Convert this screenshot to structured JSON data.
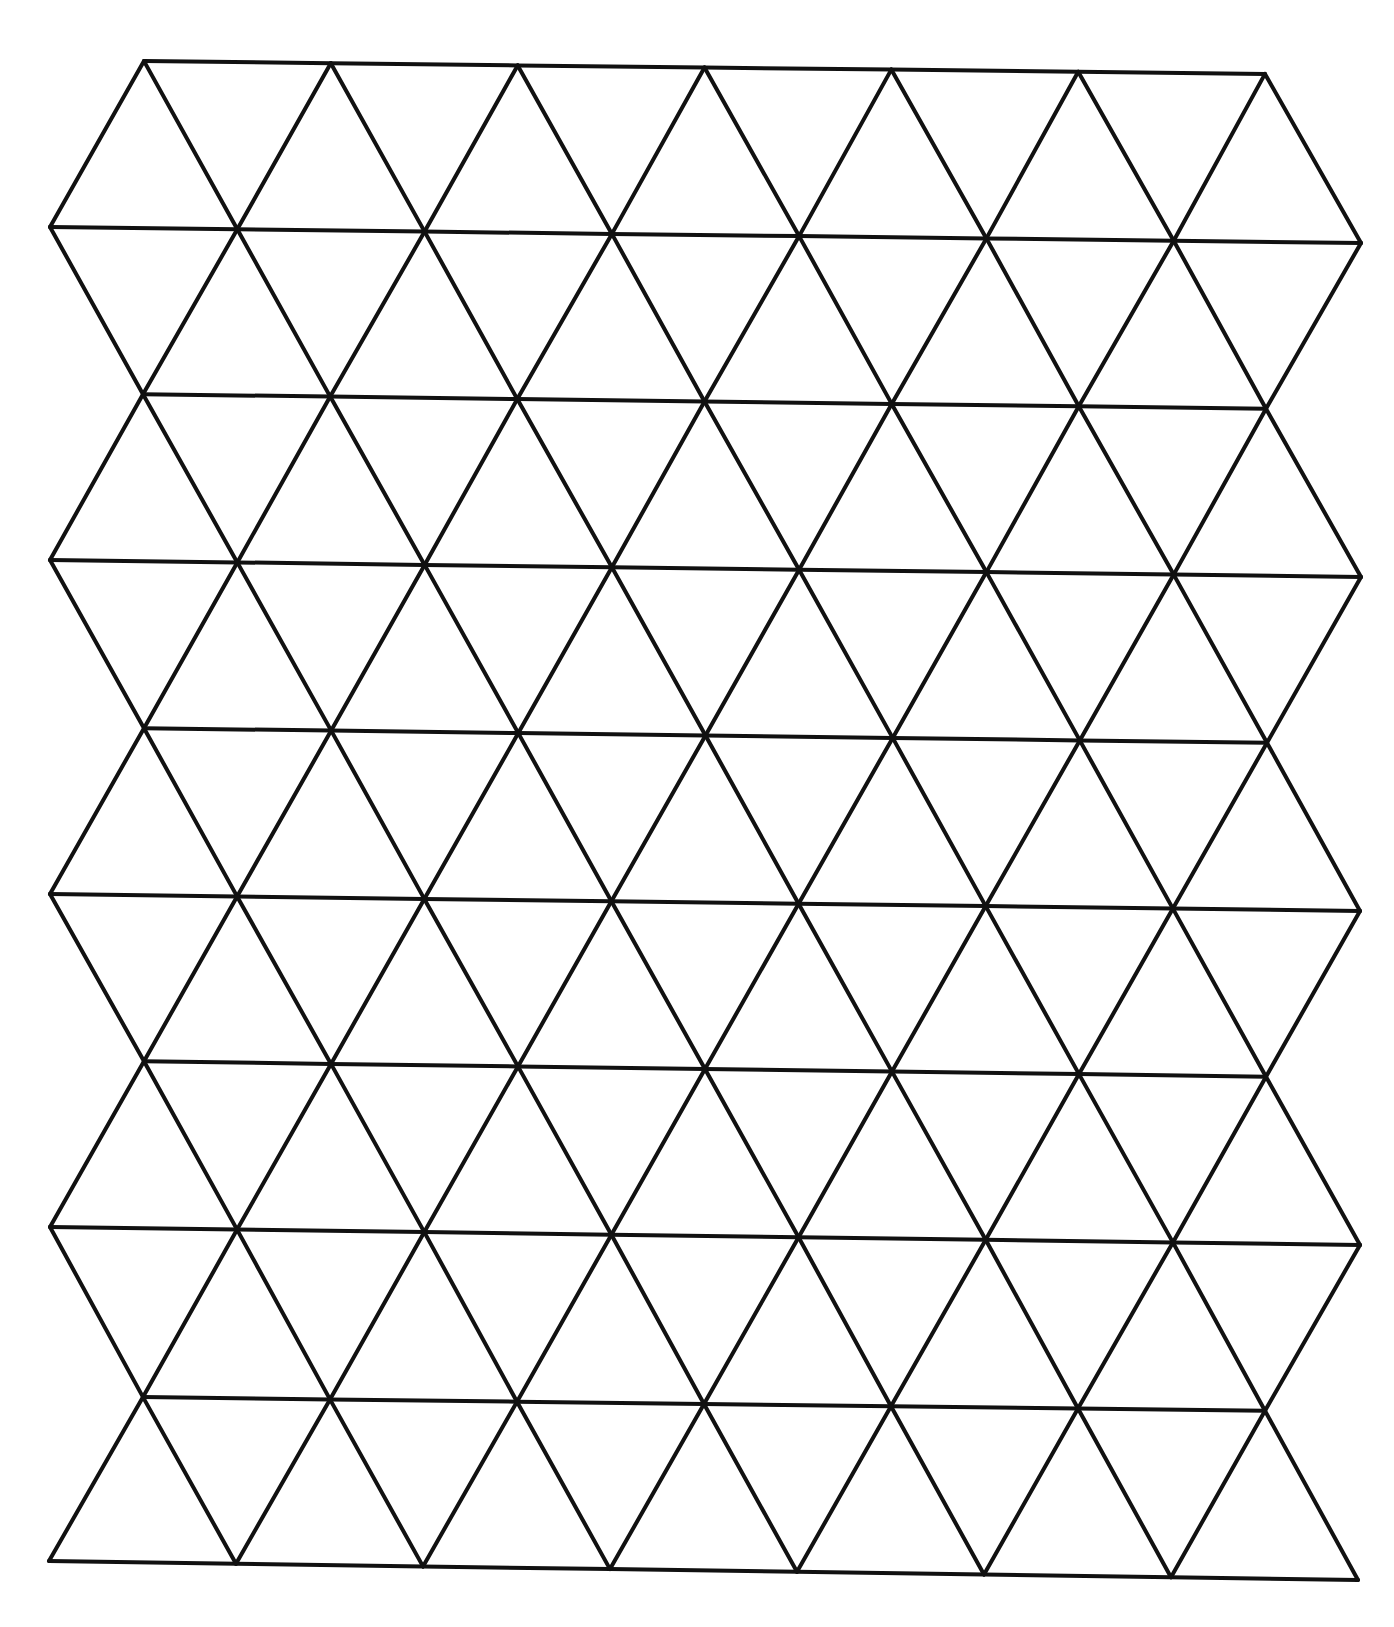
{
  "diagram": {
    "type": "isometric-triangle-grid",
    "stroke_color": "#111111",
    "background_color": "#ffffff",
    "row_count": 10,
    "rows": [
      {
        "kind": "offset",
        "count": 7,
        "x_start": 144,
        "x_end": 1265,
        "y_left": 60,
        "y_right": 75
      },
      {
        "kind": "full",
        "count": 8,
        "x_start": 50,
        "x_end": 1361,
        "y_left": 227,
        "y_right": 243
      },
      {
        "kind": "offset",
        "count": 7,
        "x_start": 143,
        "x_end": 1266,
        "y_left": 393,
        "y_right": 410
      },
      {
        "kind": "full",
        "count": 8,
        "x_start": 50,
        "x_end": 1361,
        "y_left": 560,
        "y_right": 577
      },
      {
        "kind": "offset",
        "count": 7,
        "x_start": 144,
        "x_end": 1267,
        "y_left": 727,
        "y_right": 744
      },
      {
        "kind": "full",
        "count": 8,
        "x_start": 50,
        "x_end": 1360,
        "y_left": 894,
        "y_right": 911
      },
      {
        "kind": "offset",
        "count": 7,
        "x_start": 144,
        "x_end": 1266,
        "y_left": 1060,
        "y_right": 1078
      },
      {
        "kind": "full",
        "count": 8,
        "x_start": 50,
        "x_end": 1360,
        "y_left": 1227,
        "y_right": 1245
      },
      {
        "kind": "offset",
        "count": 7,
        "x_start": 143,
        "x_end": 1265,
        "y_left": 1396,
        "y_right": 1412
      },
      {
        "kind": "full",
        "count": 8,
        "x_start": 49,
        "x_end": 1358,
        "y_left": 1561,
        "y_right": 1580
      }
    ]
  }
}
